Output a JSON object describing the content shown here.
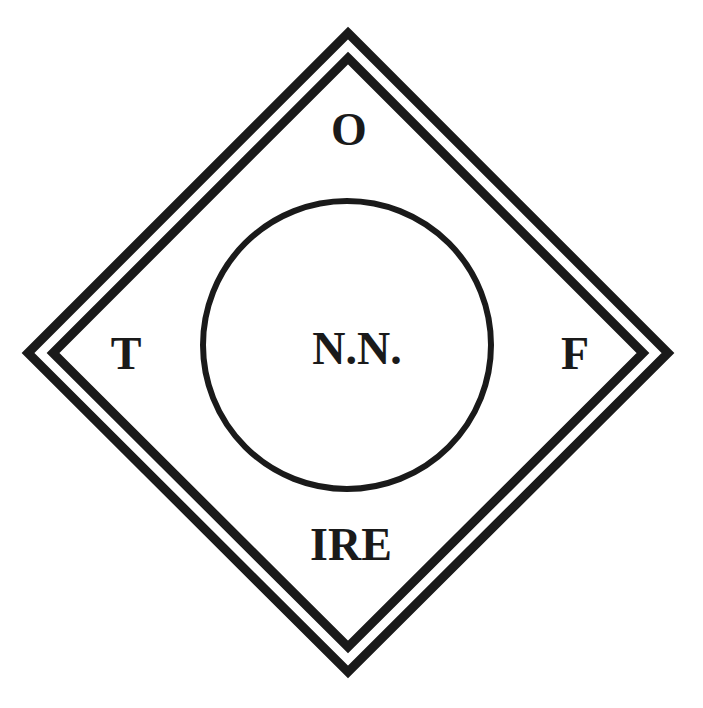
{
  "diagram": {
    "colors": {
      "stroke": "#1a1a1a",
      "background": "#ffffff"
    },
    "labels": {
      "top": "O",
      "left": "T",
      "right": "F",
      "bottom": "IRE",
      "center": "N.N."
    }
  }
}
